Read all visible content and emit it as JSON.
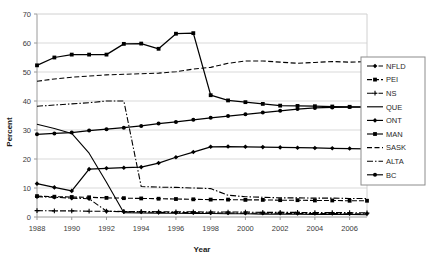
{
  "chart_data": {
    "type": "line",
    "title": "",
    "xlabel": "Year",
    "ylabel": "Percent",
    "xlim": [
      1988,
      2007
    ],
    "ylim": [
      0,
      70
    ],
    "ytick_step": 10,
    "yticks": [
      "0",
      "10",
      "20",
      "30",
      "40",
      "50",
      "60",
      "70"
    ],
    "xticks": [
      "1988",
      "1990",
      "1992",
      "1994",
      "1996",
      "1998",
      "2000",
      "2002",
      "2004",
      "2006"
    ],
    "x": [
      1988,
      1989,
      1990,
      1991,
      1992,
      1993,
      1994,
      1995,
      1996,
      1997,
      1998,
      1999,
      2000,
      2001,
      2002,
      2003,
      2004,
      2005,
      2006,
      2007
    ],
    "grid": "horizontal",
    "legend_position": "right",
    "series": [
      {
        "name": "NFLD",
        "style": "dash-dot",
        "marker": "diamond",
        "values": [
          7.0,
          6.8,
          6.5,
          6.3,
          2.0,
          1.8,
          1.7,
          1.6,
          1.5,
          1.5,
          1.4,
          1.4,
          1.3,
          1.3,
          1.3,
          1.2,
          1.2,
          1.2,
          1.1,
          1.1
        ]
      },
      {
        "name": "PEI",
        "style": "solid-dot",
        "marker": "square",
        "values": [
          7.2,
          7.0,
          6.9,
          6.8,
          6.6,
          6.5,
          6.4,
          6.3,
          6.2,
          6.1,
          6.0,
          6.0,
          5.9,
          5.9,
          5.8,
          5.8,
          5.7,
          5.7,
          5.6,
          5.6
        ]
      },
      {
        "name": "NS",
        "style": "dash-dot",
        "marker": "cross",
        "values": [
          2.2,
          2.1,
          2.1,
          2.0,
          2.0,
          1.9,
          1.9,
          1.8,
          1.8,
          1.8,
          1.7,
          1.7,
          1.7,
          1.6,
          1.6,
          1.6,
          1.5,
          1.5,
          1.5,
          1.4
        ]
      },
      {
        "name": "QUE",
        "style": "solid",
        "marker": "none",
        "values": [
          32.0,
          30.5,
          28.8,
          22.0,
          12.0,
          1.5,
          1.4,
          1.3,
          1.3,
          1.2,
          1.2,
          1.1,
          1.1,
          1.0,
          1.0,
          1.0,
          0.9,
          0.9,
          0.9,
          0.8
        ]
      },
      {
        "name": "ONT",
        "style": "solid-marker",
        "marker": "diamond",
        "values": [
          11.5,
          10.2,
          9.0,
          16.5,
          16.8,
          17.0,
          17.2,
          18.6,
          20.6,
          22.4,
          24.2,
          24.3,
          24.2,
          24.1,
          24.0,
          23.9,
          23.8,
          23.7,
          23.6,
          23.5
        ]
      },
      {
        "name": "MAN",
        "style": "solid-marker",
        "marker": "square",
        "values": [
          52.3,
          55.0,
          56.0,
          56.0,
          56.0,
          59.7,
          59.8,
          58.0,
          63.2,
          63.4,
          42.0,
          40.2,
          39.6,
          39.0,
          38.4,
          38.3,
          38.2,
          38.1,
          38.0,
          37.9
        ]
      },
      {
        "name": "SASK",
        "style": "dashed",
        "marker": "none",
        "values": [
          46.8,
          47.6,
          48.2,
          48.6,
          49.0,
          49.2,
          49.4,
          49.6,
          50.1,
          51.0,
          51.6,
          53.0,
          53.8,
          53.8,
          53.4,
          53.0,
          53.3,
          53.6,
          53.4,
          53.6
        ]
      },
      {
        "name": "ALTA",
        "style": "dash-dot",
        "marker": "none",
        "values": [
          38.2,
          38.6,
          39.0,
          39.4,
          40.0,
          40.0,
          10.5,
          10.3,
          10.2,
          10.0,
          9.8,
          7.5,
          7.0,
          6.8,
          6.6,
          6.6,
          6.5,
          6.5,
          6.4,
          6.4
        ]
      },
      {
        "name": "BC",
        "style": "solid-marker",
        "marker": "dot",
        "values": [
          28.5,
          28.8,
          29.1,
          29.8,
          30.3,
          30.8,
          31.4,
          32.2,
          32.8,
          33.5,
          34.2,
          34.8,
          35.4,
          36.0,
          36.6,
          37.2,
          37.6,
          37.8,
          37.9,
          38.0
        ]
      }
    ]
  },
  "legend": {
    "items": [
      {
        "label": "NFLD"
      },
      {
        "label": "PEI"
      },
      {
        "label": "NS"
      },
      {
        "label": "QUE"
      },
      {
        "label": "ONT"
      },
      {
        "label": "MAN"
      },
      {
        "label": "SASK"
      },
      {
        "label": "ALTA"
      },
      {
        "label": "BC"
      }
    ]
  },
  "colors": {
    "line": "#000000",
    "grid": "#d9d9d9",
    "axis": "#a6a6a6",
    "text": "#2a2a2a",
    "background": "#ffffff"
  }
}
